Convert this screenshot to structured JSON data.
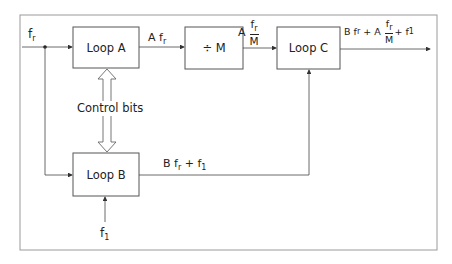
{
  "diagram": {
    "type": "block-diagram",
    "inputs": {
      "reference": {
        "symbol": "f",
        "subscript": "r"
      },
      "offset": {
        "symbol": "f",
        "subscript": "1"
      }
    },
    "blocks": [
      {
        "id": "loop_a",
        "label": "Loop A"
      },
      {
        "id": "divider",
        "label": "÷ M"
      },
      {
        "id": "loop_c",
        "label": "Loop C"
      },
      {
        "id": "loop_b",
        "label": "Loop B"
      }
    ],
    "signals": {
      "loop_a_out": {
        "coef": "A",
        "symbol": "f",
        "subscript": "r"
      },
      "divider_out": {
        "coef": "A",
        "num_symbol": "f",
        "num_subscript": "r",
        "den": "M"
      },
      "loop_b_out": {
        "part1_coef": "B",
        "part1_symbol": "f",
        "part1_subscript": "r",
        "plus": "+",
        "part2_symbol": "f",
        "part2_subscript": "1"
      },
      "loop_c_out": {
        "part1_coef": "B",
        "part1_symbol": "f",
        "part1_subscript": "r",
        "plus1": "+",
        "coef2": "A",
        "num_symbol": "f",
        "num_subscript": "r",
        "den": "M",
        "plus2": "+",
        "part3_symbol": "f",
        "part3_subscript": "1"
      }
    },
    "control_label": "Control bits",
    "connections": [
      {
        "from": "f_r",
        "to": "loop_a"
      },
      {
        "from": "f_r",
        "to": "loop_b"
      },
      {
        "from": "loop_a",
        "to": "divider"
      },
      {
        "from": "divider",
        "to": "loop_c"
      },
      {
        "from": "loop_b",
        "to": "loop_c"
      },
      {
        "from": "f_1",
        "to": "loop_b"
      },
      {
        "from": "loop_c",
        "to": "output"
      },
      {
        "between": [
          "loop_a",
          "loop_b"
        ],
        "label": "Control bits",
        "style": "double-arrow"
      }
    ],
    "colors": {
      "line": "#333333",
      "frame": "#999999",
      "background": "#ffffff"
    }
  }
}
